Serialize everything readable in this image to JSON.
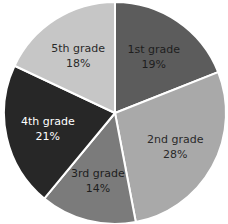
{
  "chart_data": {
    "type": "pie",
    "title": "",
    "start": "12 o'clock",
    "direction": "clockwise",
    "legend": "none (labels on slices)",
    "categories": [
      "1st grade",
      "2nd grade",
      "3rd grade",
      "4th grade",
      "5th grade"
    ],
    "values": [
      19,
      28,
      14,
      21,
      18
    ],
    "unit": "%",
    "labels": [
      {
        "category": "1st grade",
        "percent": "19%"
      },
      {
        "category": "2nd grade",
        "percent": "28%"
      },
      {
        "category": "3rd grade",
        "percent": "14%"
      },
      {
        "category": "4th grade",
        "percent": "21%"
      },
      {
        "category": "5th grade",
        "percent": "18%"
      }
    ],
    "colors": [
      "#5c5c5c",
      "#a9a9a9",
      "#7b7b7b",
      "#272727",
      "#c6c6c6"
    ],
    "label_colors": [
      "#1e1e1e",
      "#2a2a2a",
      "#1e1e1e",
      "#ffffff",
      "#2a2a2a"
    ]
  }
}
